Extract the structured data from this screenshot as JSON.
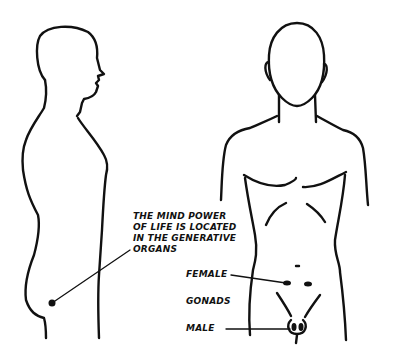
{
  "diagram": {
    "figures": [
      {
        "name": "side-profile-figure",
        "view": "side"
      },
      {
        "name": "front-view-figure",
        "view": "front"
      }
    ],
    "annotations": {
      "mind_power": {
        "lines": [
          "THE MIND POWER",
          "OF LIFE IS LOCATED",
          "IN THE GENERATIVE",
          "ORGANS"
        ]
      },
      "female": "FEMALE",
      "gonads": "GONADS",
      "male": "MALE"
    },
    "colors": {
      "ink": "#111111",
      "background": "#ffffff"
    }
  }
}
